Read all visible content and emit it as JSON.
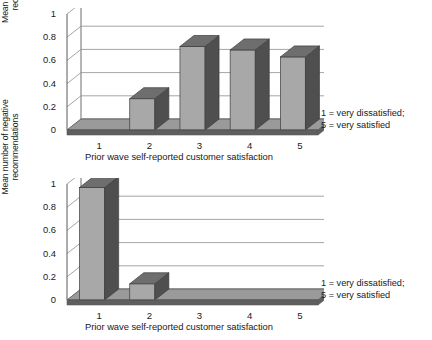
{
  "chart_data": [
    {
      "type": "bar",
      "title": "",
      "categories": [
        "1",
        "2",
        "3",
        "4",
        "5"
      ],
      "values": [
        0,
        0.27,
        0.72,
        0.69,
        0.63
      ],
      "xlabel": "Prior wave self-reported customer satisfaction",
      "ylabel_line1": "Mean number of positive",
      "ylabel_line2": "recommendations",
      "yticks": [
        "0",
        "0.2",
        "0.4",
        "0.6",
        "0.8",
        "1"
      ],
      "ytickvals": [
        0,
        0.2,
        0.4,
        0.6,
        0.8,
        1
      ],
      "ylim": [
        0,
        1
      ],
      "grid": true,
      "legend_position": "right",
      "legend_line1": "1 = very dissatisfied;",
      "legend_line2": "5 = very satisfied",
      "bar_face_color": "#a8a8a8",
      "bar_side_color": "#4f4f4f",
      "bar_top_color": "#6e6e6e"
    },
    {
      "type": "bar",
      "title": "",
      "categories": [
        "1",
        "2",
        "3",
        "4",
        "5"
      ],
      "values": [
        0.97,
        0.14,
        0,
        0,
        0
      ],
      "xlabel": "Prior wave self-reported customer satisfaction",
      "ylabel_line1": "Mean number of negative",
      "ylabel_line2": "recommendations",
      "yticks": [
        "0",
        "0.2",
        "0.4",
        "0.6",
        "0.8",
        "1"
      ],
      "ytickvals": [
        0,
        0.2,
        0.4,
        0.6,
        0.8,
        1
      ],
      "ylim": [
        0,
        1
      ],
      "grid": true,
      "legend_position": "right",
      "legend_line1": "1 = very dissatisfied;",
      "legend_line2": "5 = very satisfied",
      "bar_face_color": "#a8a8a8",
      "bar_side_color": "#4f4f4f",
      "bar_top_color": "#6e6e6e"
    }
  ]
}
